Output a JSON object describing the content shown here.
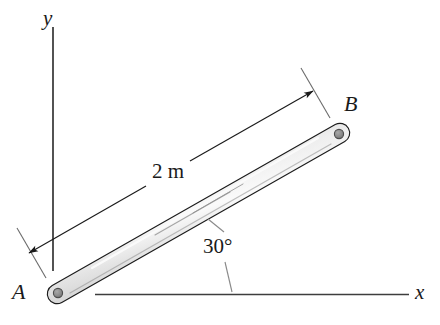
{
  "figure": {
    "type": "engineering-mechanics-diagram",
    "background_color": "#ffffff",
    "line_color": "#1a1a1a",
    "bar": {
      "name": "bar-AB",
      "length_label": "2 m",
      "angle_label": "30°",
      "angle_degrees": 30,
      "end_a_label": "A",
      "end_b_label": "B",
      "fill_light": "#f2f2f2",
      "fill_mid": "#d9d9d9",
      "fill_dark": "#b3b3b3",
      "outline_color": "#1c1c1c",
      "pin_color": "#8c8c8c",
      "pin_outline": "#4d4d4d"
    },
    "axes": {
      "y_axis_label": "y",
      "x_axis_label": "x",
      "axis_color": "#4a4a4a"
    },
    "dimension": {
      "label": "2 m",
      "arrow_color": "#1a1a1a",
      "extension_line_color": "#6b6b6b"
    },
    "annotation": {
      "angle_text": "30°",
      "leader_color": "#8a8a8a"
    }
  }
}
